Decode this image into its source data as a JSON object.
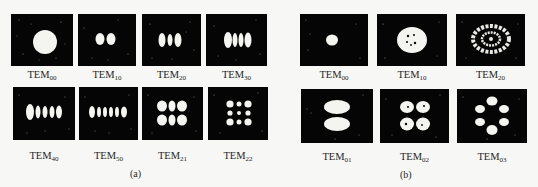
{
  "figure": {
    "top_fragment": "",
    "panel_a": {
      "caption": "(a)",
      "modes": [
        {
          "prefix": "TEM",
          "sub": "00",
          "pattern": "single-spot"
        },
        {
          "prefix": "TEM",
          "sub": "10",
          "pattern": "2-lobes-horizontal"
        },
        {
          "prefix": "TEM",
          "sub": "20",
          "pattern": "3-lobes-horizontal"
        },
        {
          "prefix": "TEM",
          "sub": "30",
          "pattern": "4-lobes-horizontal"
        },
        {
          "prefix": "TEM",
          "sub": "40",
          "pattern": "5-lobes-horizontal"
        },
        {
          "prefix": "TEM",
          "sub": "50",
          "pattern": "6-lobes-horizontal"
        },
        {
          "prefix": "TEM",
          "sub": "21",
          "pattern": "3x2-grid"
        },
        {
          "prefix": "TEM",
          "sub": "22",
          "pattern": "3x3-grid"
        }
      ]
    },
    "panel_b": {
      "caption": "(b)",
      "modes": [
        {
          "prefix": "TEM",
          "sub": "00",
          "pattern": "single-spot"
        },
        {
          "prefix": "TEM",
          "sub": "10",
          "pattern": "ring-with-center-dots"
        },
        {
          "prefix": "TEM",
          "sub": "20",
          "pattern": "double-ring"
        },
        {
          "prefix": "TEM",
          "sub": "01",
          "pattern": "2-lobes-vertical"
        },
        {
          "prefix": "TEM",
          "sub": "02",
          "pattern": "4-petal"
        },
        {
          "prefix": "TEM",
          "sub": "03",
          "pattern": "6-petal"
        }
      ]
    },
    "colors": {
      "background": "#f7f7f5",
      "panel": "#050505",
      "beam": "#f4f4f0",
      "text": "#262626"
    }
  }
}
